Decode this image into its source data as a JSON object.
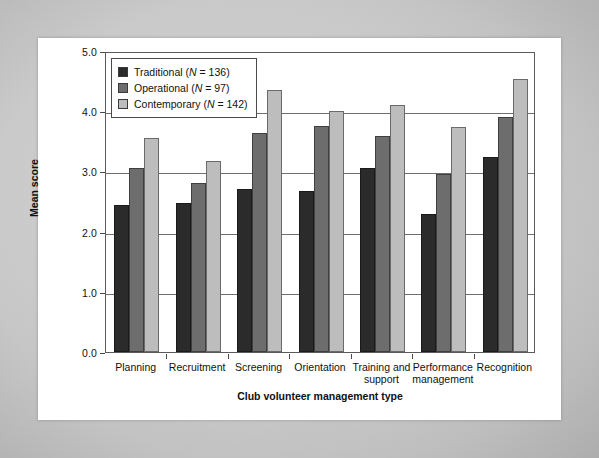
{
  "chart_data": {
    "type": "bar",
    "title": "",
    "xlabel": "Club volunteer management type",
    "ylabel": "Mean score",
    "ylim": [
      0.0,
      5.0
    ],
    "ytick_labels": [
      "0.0",
      "1.0",
      "2.0",
      "3.0",
      "4.0",
      "5.0"
    ],
    "yticks": [
      0.0,
      1.0,
      2.0,
      3.0,
      4.0,
      5.0
    ],
    "grid": true,
    "legend_position": "upper-left",
    "categories": [
      "Planning",
      "Recruitment",
      "Screening",
      "Orientation",
      "Training and support",
      "Performance management",
      "Recognition"
    ],
    "series": [
      {
        "name": "Traditional",
        "n": 136,
        "legend_label": "Traditional (N = 136)",
        "color": "#2b2b2b",
        "values": [
          2.45,
          2.48,
          2.7,
          2.68,
          3.06,
          2.3,
          3.24
        ]
      },
      {
        "name": "Operational",
        "n": 97,
        "legend_label": "Operational (N = 97)",
        "color": "#6d6d6d",
        "values": [
          3.06,
          2.8,
          3.63,
          3.75,
          3.58,
          2.96,
          3.9
        ]
      },
      {
        "name": "Contemporary",
        "n": 142,
        "legend_label": "Contemporary (N = 142)",
        "color": "#bdbdbd",
        "values": [
          3.56,
          3.18,
          4.35,
          4.0,
          4.1,
          3.73,
          4.53
        ]
      }
    ]
  },
  "legend": {
    "items": [
      {
        "label_prefix": "Traditional (",
        "n_symbol": "N",
        "label_suffix": " = 136)"
      },
      {
        "label_prefix": "Operational (",
        "n_symbol": "N",
        "label_suffix": " = 97)"
      },
      {
        "label_prefix": "Contemporary (",
        "n_symbol": "N",
        "label_suffix": " = 142)"
      }
    ]
  }
}
